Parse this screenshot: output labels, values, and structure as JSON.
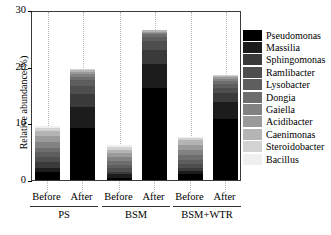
{
  "chart_data": {
    "type": "bar",
    "subtype": "stacked-bar",
    "title": "",
    "xlabel": "",
    "ylabel": "Relative abundance(%)",
    "ylim": [
      0,
      30
    ],
    "yticks": [
      0,
      10,
      20,
      30
    ],
    "ytick_labels": [
      "0",
      "10",
      "20",
      "30"
    ],
    "grid": "vertical-dotted",
    "legend_position": "right",
    "categories": [
      "Before",
      "After",
      "Before",
      "After",
      "Before",
      "After"
    ],
    "groups": [
      {
        "name": "PS",
        "bars": [
          "Before",
          "After"
        ]
      },
      {
        "name": "BSM",
        "bars": [
          "Before",
          "After"
        ]
      },
      {
        "name": "BSM+WTR",
        "bars": [
          "Before",
          "After"
        ]
      }
    ],
    "series": [
      {
        "name": "Pseudomonas",
        "color": "#000000",
        "values": [
          1.5,
          9.2,
          0.4,
          16.2,
          1.1,
          10.7
        ]
      },
      {
        "name": "Massilia",
        "color": "#1c1c1c",
        "values": [
          0.7,
          3.7,
          0.6,
          4.3,
          0.5,
          3.1
        ]
      },
      {
        "name": "Sphingomonas",
        "color": "#3a3a3a",
        "values": [
          0.9,
          2.3,
          0.5,
          2.5,
          0.6,
          1.5
        ]
      },
      {
        "name": "Ramlibacter",
        "color": "#4e4e4e",
        "values": [
          0.9,
          1.4,
          0.6,
          1.5,
          0.7,
          1.0
        ]
      },
      {
        "name": "Lysobacter",
        "color": "#5e5e5e",
        "values": [
          0.9,
          1.0,
          0.6,
          0.8,
          0.7,
          0.7
        ]
      },
      {
        "name": "Dongia",
        "color": "#6e6e6e",
        "values": [
          0.8,
          0.6,
          0.6,
          0.4,
          0.8,
          0.5
        ]
      },
      {
        "name": "Gaiella",
        "color": "#828282",
        "values": [
          1.0,
          0.5,
          0.7,
          0.3,
          0.9,
          0.4
        ]
      },
      {
        "name": "Acidibacter",
        "color": "#9a9a9a",
        "values": [
          1.0,
          0.4,
          0.7,
          0.2,
          0.9,
          0.3
        ]
      },
      {
        "name": "Caenimonas",
        "color": "#b4b4b4",
        "values": [
          0.9,
          0.3,
          0.6,
          0.2,
          0.8,
          0.2
        ]
      },
      {
        "name": "Steroidobacter",
        "color": "#d2d2d2",
        "values": [
          0.6,
          0.15,
          0.5,
          0.1,
          0.4,
          0.1
        ]
      },
      {
        "name": "Bacillus",
        "color": "#efefef",
        "values": [
          0.3,
          0.05,
          0.4,
          0.05,
          0.2,
          0.05
        ]
      }
    ],
    "bar_totals": [
      9.5,
      19.6,
      6.2,
      26.5,
      7.6,
      18.5
    ]
  },
  "axis": {
    "y_title": "Relative abundance(%)",
    "y_ticks": [
      "30",
      "20",
      "10",
      "0"
    ]
  },
  "x_labels": [
    "Before",
    "After",
    "Before",
    "After",
    "Before",
    "After"
  ],
  "group_labels": [
    "PS",
    "BSM",
    "BSM+WTR"
  ],
  "legend": {
    "items": [
      {
        "label": "Pseudomonas",
        "color": "#000000"
      },
      {
        "label": "Massilia",
        "color": "#1c1c1c"
      },
      {
        "label": "Sphingomonas",
        "color": "#3a3a3a"
      },
      {
        "label": "Ramlibacter",
        "color": "#4e4e4e"
      },
      {
        "label": "Lysobacter",
        "color": "#5e5e5e"
      },
      {
        "label": "Dongia",
        "color": "#6e6e6e"
      },
      {
        "label": "Gaiella",
        "color": "#828282"
      },
      {
        "label": "Acidibacter",
        "color": "#9a9a9a"
      },
      {
        "label": "Caenimonas",
        "color": "#b4b4b4"
      },
      {
        "label": "Steroidobacter",
        "color": "#d2d2d2"
      },
      {
        "label": "Bacillus",
        "color": "#efefef"
      }
    ]
  }
}
